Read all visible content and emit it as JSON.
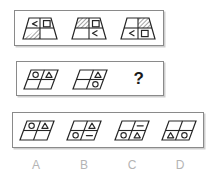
{
  "puzzle": {
    "type": "visual-analogy-matrix",
    "question_mark": "?",
    "stroke_color": "#262626",
    "hatch_color": "#555555",
    "panel_border_color": "#8a8a8a",
    "label_color": "#b4b4b4",
    "row1": {
      "name": "trapezoid-sequence",
      "shape": "trapezoid",
      "figures": [
        {
          "id": "row1-fig1",
          "cells": {
            "top_left": "less-than-sign",
            "top_right": "square",
            "bottom_left": "hatched",
            "bottom_right": "empty"
          }
        },
        {
          "id": "row1-fig2",
          "cells": {
            "top_left": "hatched",
            "top_right": "square",
            "bottom_left": "empty",
            "bottom_right": "less-than-sign"
          }
        },
        {
          "id": "row1-fig3",
          "cells": {
            "top_left": "empty",
            "top_right": "hatched",
            "bottom_left": "less-than-sign",
            "bottom_right": "square"
          }
        }
      ]
    },
    "row2": {
      "name": "parallelogram-sequence",
      "shape": "parallelogram",
      "figures": [
        {
          "id": "row2-fig1",
          "cells": {
            "top_left": "circle",
            "top_right": "triangle",
            "bottom_left": "empty",
            "bottom_right": "empty"
          }
        },
        {
          "id": "row2-fig2",
          "cells": {
            "top_left": "empty",
            "top_right": "triangle",
            "bottom_left": "empty",
            "bottom_right": "circle"
          }
        }
      ]
    },
    "row3": {
      "name": "answer-options",
      "shape": "parallelogram",
      "options": [
        {
          "id": "option-a",
          "label": "A",
          "cells": {
            "top_left": "circle",
            "top_right": "triangle",
            "bottom_left": "empty",
            "bottom_right": "empty"
          }
        },
        {
          "id": "option-b",
          "label": "B",
          "cells": {
            "top_left": "empty",
            "top_right": "triangle",
            "bottom_left": "circle",
            "bottom_right": "dash"
          }
        },
        {
          "id": "option-c",
          "label": "C",
          "cells": {
            "top_left": "empty",
            "top_right": "dash",
            "bottom_left": "circle",
            "bottom_right": "triangle"
          }
        },
        {
          "id": "option-d",
          "label": "D",
          "cells": {
            "top_left": "empty",
            "top_right": "empty",
            "bottom_left": "triangle",
            "bottom_right": "circle"
          }
        }
      ]
    }
  }
}
